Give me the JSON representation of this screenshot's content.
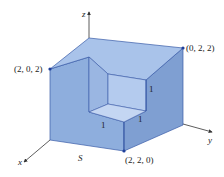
{
  "figure": {
    "type": "3d-solid-with-corner-removed",
    "surface_label": "S",
    "axes": {
      "x": "x",
      "y": "y",
      "z": "z"
    },
    "vertices": {
      "top_left": "(2, 0, 2)",
      "top_right": "(0, 2, 2)",
      "bottom_front": "(2, 2, 0)"
    },
    "cutout_edge_labels": {
      "vertical": "1",
      "front_right": "1",
      "front_left": "1"
    },
    "colors": {
      "top_face": "#a9c3ea",
      "left_face": "#8eaedd",
      "right_face": "#7f9fd2",
      "edge": "#3a5ba8",
      "vertex_dot": "#1f3f9a",
      "axis": "#333333"
    }
  }
}
